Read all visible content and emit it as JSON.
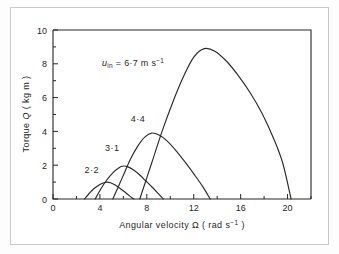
{
  "figure": {
    "background_color": "#ffffff",
    "border_color": "#c9c9c9",
    "ink_color": "#262626"
  },
  "axes": {
    "x_title_main": "Angular velocity",
    "x_title_symbol": "Ω",
    "x_title_units_open": "( rad s",
    "x_title_units_exp": "−1",
    "x_title_units_close": " )",
    "y_title_main": "Torque",
    "y_title_symbol": "Q",
    "y_title_units": "( kg m )",
    "x_ticklabels": [
      "0",
      "4",
      "8",
      "12",
      "16",
      "20"
    ],
    "y_ticklabels": [
      "0",
      "2",
      "4",
      "6",
      "8",
      "10"
    ]
  },
  "annotation": {
    "symbol": "u",
    "subscript": "in",
    "equals": " = 6·7 m s",
    "exponent": "−1"
  },
  "curve_labels": {
    "c22": "2·2",
    "c31": "3·1",
    "c44": "4·4",
    "c67": "6·7"
  },
  "chart_data": {
    "type": "line",
    "title": "",
    "xlabel": "Angular velocity Ω (rad s⁻¹)",
    "ylabel": "Torque Q (kg m)",
    "xlim": [
      0,
      22
    ],
    "ylim": [
      0,
      10
    ],
    "xticks": [
      0,
      4,
      8,
      12,
      16,
      20
    ],
    "yticks": [
      0,
      2,
      4,
      6,
      8,
      10
    ],
    "xminorticks": [
      2,
      6,
      10,
      14,
      18,
      22
    ],
    "yminorticks": [
      1,
      3,
      5,
      7,
      9
    ],
    "grid": false,
    "legend": "none",
    "series_label_note": "Curves are labelled in-plot by wind speed u_in in m s^-1",
    "series": [
      {
        "name": "2·2 m s⁻¹",
        "wind_speed": 2.2,
        "label_position": {
          "x": 3.3,
          "y": 1.55
        },
        "peak": {
          "x": 4.6,
          "y": 1.0
        },
        "x": [
          2.7,
          3.1,
          3.5,
          4.0,
          4.4,
          4.6,
          4.9,
          5.3,
          5.7,
          6.1,
          6.5,
          6.9
        ],
        "y": [
          0.0,
          0.34,
          0.62,
          0.86,
          0.98,
          1.0,
          0.96,
          0.83,
          0.64,
          0.43,
          0.2,
          0.0
        ]
      },
      {
        "name": "3·1 m s⁻¹",
        "wind_speed": 3.1,
        "label_position": {
          "x": 5.05,
          "y": 2.85
        },
        "peak": {
          "x": 6.0,
          "y": 1.95
        },
        "x": [
          3.6,
          4.1,
          4.6,
          5.1,
          5.6,
          6.0,
          6.4,
          6.9,
          7.4,
          7.9,
          8.4,
          8.9,
          9.4
        ],
        "y": [
          0.0,
          0.62,
          1.14,
          1.55,
          1.84,
          1.95,
          1.9,
          1.7,
          1.42,
          1.08,
          0.74,
          0.38,
          0.0
        ]
      },
      {
        "name": "4·4 m s⁻¹",
        "wind_speed": 4.4,
        "label_position": {
          "x": 7.25,
          "y": 4.55
        },
        "peak": {
          "x": 8.4,
          "y": 3.9
        },
        "x": [
          5.1,
          5.9,
          6.6,
          7.2,
          7.8,
          8.4,
          9.0,
          9.7,
          10.5,
          11.3,
          12.1,
          12.8,
          13.4
        ],
        "y": [
          0.0,
          1.25,
          2.35,
          3.1,
          3.65,
          3.9,
          3.8,
          3.45,
          2.85,
          2.15,
          1.4,
          0.7,
          0.0
        ]
      },
      {
        "name": "6·7 m s⁻¹",
        "wind_speed": 6.7,
        "label_position": {
          "x": 8.2,
          "y": 8.25
        },
        "peak": {
          "x": 12.9,
          "y": 8.9
        },
        "x": [
          7.4,
          8.4,
          9.3,
          10.2,
          11.1,
          12.0,
          12.9,
          13.8,
          14.8,
          15.8,
          16.8,
          17.8,
          18.8,
          19.6,
          20.3
        ],
        "y": [
          0.0,
          2.1,
          4.0,
          5.7,
          7.2,
          8.4,
          8.9,
          8.75,
          8.15,
          7.3,
          6.3,
          5.1,
          3.6,
          2.1,
          0.0
        ]
      }
    ]
  }
}
